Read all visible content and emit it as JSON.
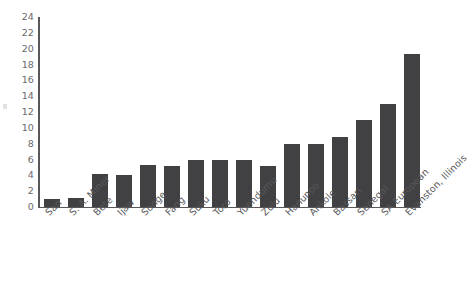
{
  "chart_data": {
    "type": "bar",
    "title": "",
    "subtitle": "",
    "xlabel": "",
    "ylabel": "",
    "ylim": [
      0,
      24
    ],
    "yticks": [
      0,
      2,
      4,
      6,
      8,
      10,
      12,
      14,
      16,
      18,
      20,
      22,
      24
    ],
    "grid": false,
    "legend": null,
    "bar_color": "#414042",
    "axis_color": "#58585a",
    "background_color": "#ffffff",
    "categories": [
      "San",
      "S. A. Miner",
      "Bete",
      "Ijaw",
      "Songe",
      "Fang",
      "Suku",
      "Toro",
      "Yuendumu",
      "Zulu",
      "Hanunoo",
      "Ankole",
      "Bassari",
      "Senegal",
      "SA European",
      "Evanston, Illinois"
    ],
    "values": [
      1.0,
      1.2,
      4.2,
      4.1,
      5.3,
      5.2,
      6.0,
      6.0,
      6.0,
      5.2,
      7.9,
      7.9,
      8.8,
      11.0,
      13.0,
      19.3
    ]
  }
}
